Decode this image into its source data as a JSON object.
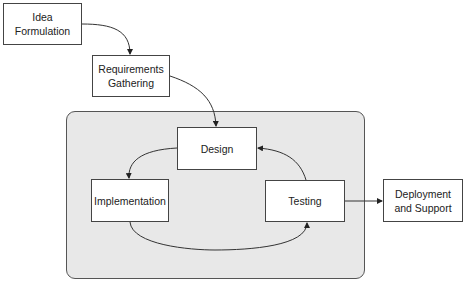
{
  "diagram": {
    "type": "process-flow",
    "nodes": [
      {
        "id": "idea",
        "label": "Idea\nFormulation"
      },
      {
        "id": "requirements",
        "label": "Requirements\nGathering"
      },
      {
        "id": "design",
        "label": "Design"
      },
      {
        "id": "implementation",
        "label": "Implementation"
      },
      {
        "id": "testing",
        "label": "Testing"
      },
      {
        "id": "deployment",
        "label": "Deployment\nand Support"
      }
    ],
    "edges": [
      {
        "from": "idea",
        "to": "requirements"
      },
      {
        "from": "requirements",
        "to": "design"
      },
      {
        "from": "design",
        "to": "implementation"
      },
      {
        "from": "implementation",
        "to": "testing"
      },
      {
        "from": "testing",
        "to": "design"
      },
      {
        "from": "testing",
        "to": "deployment"
      }
    ],
    "group": {
      "label": "",
      "members": [
        "design",
        "implementation",
        "testing"
      ]
    },
    "colors": {
      "group_fill": "#e8e8e8",
      "box_fill": "#ffffff",
      "stroke": "#333333"
    }
  }
}
